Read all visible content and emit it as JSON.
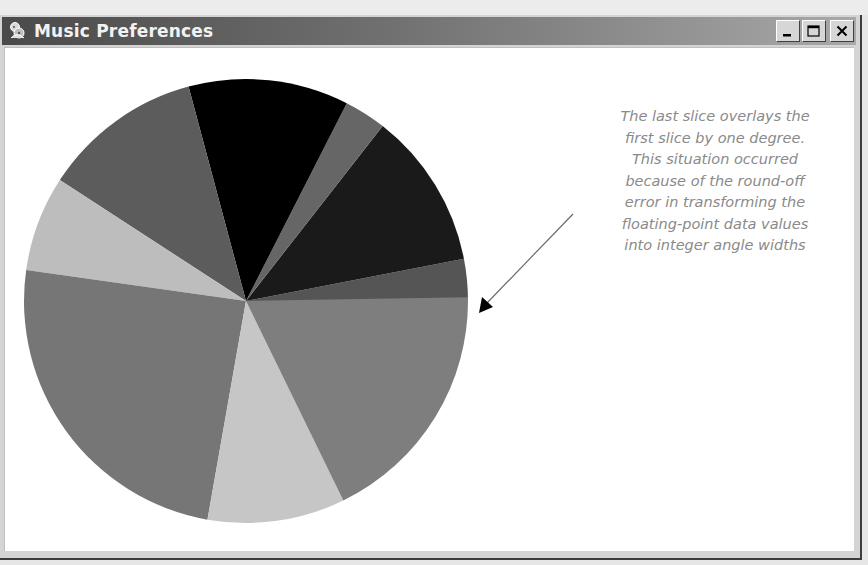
{
  "window": {
    "title": "Music Preferences",
    "icon": "music-app-icon",
    "buttons": {
      "minimize": "minimize-icon",
      "maximize": "maximize-icon",
      "close": "close-icon"
    }
  },
  "annotation": {
    "lines": [
      "The last slice overlays the",
      "first slice by one degree.",
      "This situation occurred",
      "because of the round-off",
      "error in transforming the",
      "floating-point data values",
      "into integer angle widths"
    ],
    "arrow_target": "overlap-edge-at-0-degrees"
  },
  "chart_data": {
    "type": "pie",
    "title": "Music Preferences",
    "legend": "none",
    "labels_visible": false,
    "start_angle_deg": 0,
    "direction": "counterclockwise",
    "note": "Last slice ends at 361 degrees, overlapping the first slice by one degree",
    "slices": [
      {
        "index": 1,
        "start_deg": 0,
        "end_deg": 11,
        "percent": 3.1,
        "color": "#555555"
      },
      {
        "index": 2,
        "start_deg": 11,
        "end_deg": 52,
        "percent": 11.4,
        "color": "#1a1a1a"
      },
      {
        "index": 3,
        "start_deg": 52,
        "end_deg": 63,
        "percent": 3.1,
        "color": "#666666"
      },
      {
        "index": 4,
        "start_deg": 63,
        "end_deg": 105,
        "percent": 11.7,
        "color": "#000000"
      },
      {
        "index": 5,
        "start_deg": 105,
        "end_deg": 147,
        "percent": 11.7,
        "color": "#5c5c5c"
      },
      {
        "index": 6,
        "start_deg": 147,
        "end_deg": 172,
        "percent": 6.9,
        "color": "#bdbdbd"
      },
      {
        "index": 7,
        "start_deg": 172,
        "end_deg": 260,
        "percent": 24.4,
        "color": "#767676"
      },
      {
        "index": 8,
        "start_deg": 260,
        "end_deg": 296,
        "percent": 10.0,
        "color": "#c6c6c6"
      },
      {
        "index": 9,
        "start_deg": 296,
        "end_deg": 361,
        "percent": 17.8,
        "color": "#7e7e7e"
      }
    ]
  }
}
